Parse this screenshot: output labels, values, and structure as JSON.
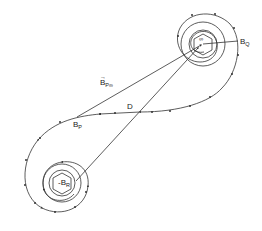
{
  "diagram": {
    "type": "figure-eight spiral field-line diagram",
    "labels": {
      "bq": {
        "main": "B",
        "sub": "Q"
      },
      "bp": {
        "main": "B",
        "sub": "P"
      },
      "br": {
        "main": "-B",
        "sub": "R"
      },
      "d": "D",
      "bpinf": {
        "main": "B",
        "sub": "P∞"
      },
      "infinity": "∞"
    },
    "colors": {
      "line": "#333333",
      "background": "#ffffff",
      "label_sub_accent": "#3a3a3a"
    }
  }
}
